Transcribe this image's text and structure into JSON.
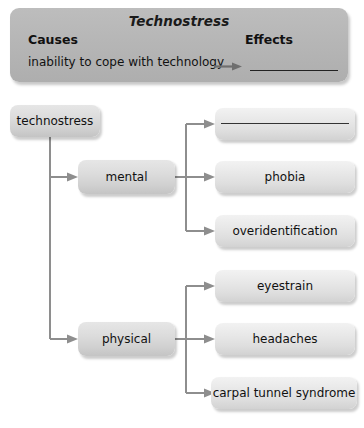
{
  "header": {
    "title": "Technostress",
    "causes_label": "Causes",
    "effects_label": "Effects",
    "cause_item": "inability to cope with technology",
    "effect_item": "",
    "arrow_icon": "arrow-right-icon",
    "blank_line_icon": "fill-in-blank-line"
  },
  "diagram": {
    "root": {
      "label": "technostress"
    },
    "branches": [
      {
        "label": "mental",
        "children": [
          {
            "label": "",
            "blank": true
          },
          {
            "label": "phobia",
            "blank": false
          },
          {
            "label": "overidentification",
            "blank": false
          }
        ]
      },
      {
        "label": "physical",
        "children": [
          {
            "label": "eyestrain",
            "blank": false
          },
          {
            "label": "headaches",
            "blank": false
          },
          {
            "label": "carpal tunnel syndrome",
            "blank": false
          }
        ]
      }
    ]
  },
  "colors": {
    "header_panel": "#b6b6b6",
    "node_fill": "#e8e8e8",
    "connector": "#8e8e8e",
    "text": "#111111"
  }
}
